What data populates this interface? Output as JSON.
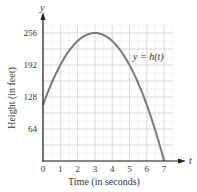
{
  "chart_data": {
    "type": "line",
    "title": "",
    "xlabel": "Time (in seconds)",
    "ylabel": "Height (in feet)",
    "x_axis_var": "t",
    "y_axis_var": "y",
    "curve_label": "y = h(t)",
    "xlim": [
      0,
      7.5
    ],
    "ylim": [
      0,
      272
    ],
    "x_ticks": [
      0,
      1,
      2,
      3,
      4,
      5,
      6,
      7
    ],
    "y_ticks": [
      64,
      128,
      192,
      256
    ],
    "grid": true,
    "grid_minor_x": 0.5,
    "grid_minor_y": 16,
    "series": [
      {
        "name": "y = h(t)",
        "x": [
          0,
          0.5,
          1,
          1.5,
          2,
          2.5,
          3,
          3.5,
          4,
          4.5,
          5,
          5.5,
          6,
          6.5,
          7
        ],
        "values": [
          112,
          156,
          192,
          220,
          240,
          252,
          256,
          252,
          240,
          220,
          192,
          156,
          112,
          60,
          0
        ]
      }
    ],
    "colors": {
      "curve": "#7a7a7a",
      "axis": "#222222",
      "grid": "#cfcfcf"
    }
  }
}
